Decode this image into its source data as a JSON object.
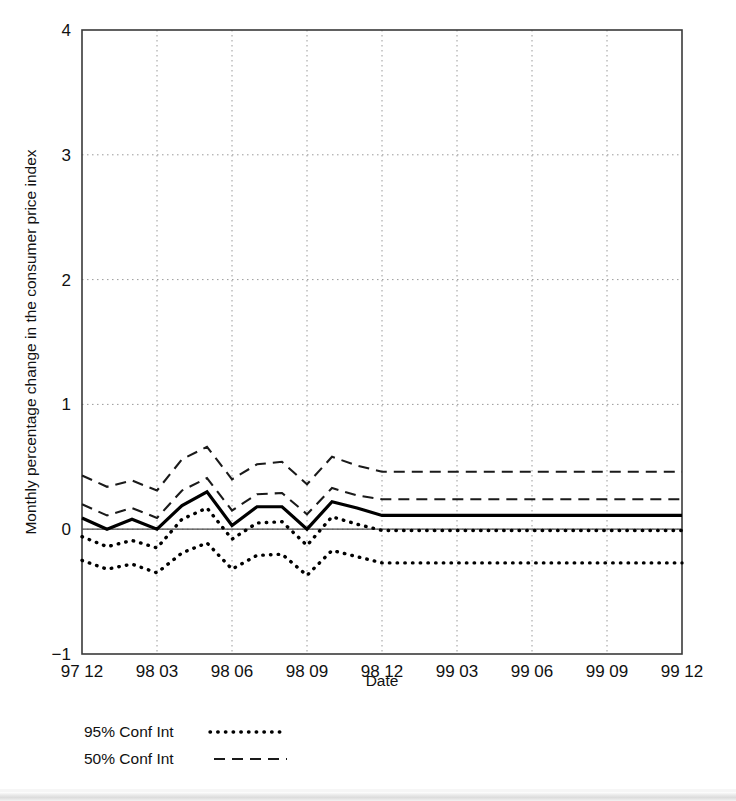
{
  "chart_data": {
    "type": "line",
    "title": "",
    "xlabel": "Date",
    "ylabel": "Monthly percentage change in the consumer price index",
    "ylim": [
      -1,
      4
    ],
    "yticks": [
      "4",
      "3",
      "2",
      "1",
      "0",
      "−1"
    ],
    "ytick_values": [
      4,
      3,
      2,
      1,
      0,
      -1
    ],
    "xticks": [
      "97 12",
      "98 03",
      "98 06",
      "98 09",
      "98 12",
      "99 03",
      "99 06",
      "99 09",
      "99 12"
    ],
    "grid": "dotted, both axes at tick positions",
    "legend_position": "below-left, outside axes",
    "legend": [
      {
        "label": "95% Conf Int",
        "style": "dotted"
      },
      {
        "label": "50% Conf Int",
        "style": "dashed"
      }
    ],
    "x": [
      "97 12",
      "98 01",
      "98 02",
      "98 03",
      "98 04",
      "98 05",
      "98 06",
      "98 07",
      "98 08",
      "98 09",
      "98 10",
      "98 11",
      "98 12",
      "99 01",
      "99 02",
      "99 03",
      "99 04",
      "99 05",
      "99 06",
      "99 07",
      "99 08",
      "99 09",
      "99 10",
      "99 11",
      "99 12"
    ],
    "series": [
      {
        "name": "Central projection",
        "style": "solid",
        "values": [
          0.09,
          0.0,
          0.08,
          0.0,
          0.19,
          0.3,
          0.03,
          0.18,
          0.18,
          0.0,
          0.22,
          0.17,
          0.11,
          0.11,
          0.11,
          0.11,
          0.11,
          0.11,
          0.11,
          0.11,
          0.11,
          0.11,
          0.11,
          0.11,
          0.11
        ]
      },
      {
        "name": "50% Conf Int upper",
        "style": "dashed",
        "values": [
          0.43,
          0.34,
          0.39,
          0.31,
          0.56,
          0.66,
          0.4,
          0.52,
          0.54,
          0.36,
          0.58,
          0.51,
          0.46,
          0.46,
          0.46,
          0.46,
          0.46,
          0.46,
          0.46,
          0.46,
          0.46,
          0.46,
          0.46,
          0.46,
          0.46
        ]
      },
      {
        "name": "50% Conf Int lower",
        "style": "dashed",
        "values": [
          0.2,
          0.11,
          0.17,
          0.09,
          0.31,
          0.41,
          0.15,
          0.28,
          0.29,
          0.12,
          0.33,
          0.27,
          0.24,
          0.24,
          0.24,
          0.24,
          0.24,
          0.24,
          0.24,
          0.24,
          0.24,
          0.24,
          0.24,
          0.24,
          0.24
        ]
      },
      {
        "name": "95% Conf Int upper",
        "style": "dotted",
        "values": [
          -0.06,
          -0.14,
          -0.09,
          -0.15,
          0.08,
          0.17,
          -0.08,
          0.05,
          0.06,
          -0.13,
          0.1,
          0.04,
          -0.01,
          -0.01,
          -0.01,
          -0.01,
          -0.01,
          -0.01,
          -0.01,
          -0.01,
          -0.01,
          -0.01,
          -0.01,
          -0.01,
          -0.01
        ]
      },
      {
        "name": "95% Conf Int lower",
        "style": "dotted",
        "values": [
          -0.25,
          -0.32,
          -0.28,
          -0.35,
          -0.19,
          -0.11,
          -0.32,
          -0.21,
          -0.2,
          -0.37,
          -0.17,
          -0.22,
          -0.27,
          -0.27,
          -0.27,
          -0.27,
          -0.27,
          -0.27,
          -0.27,
          -0.27,
          -0.27,
          -0.27,
          -0.27,
          -0.27,
          -0.27
        ]
      }
    ],
    "zero_reference_line": 0
  },
  "axis": {
    "x_title": "Date",
    "y_title": "Monthly percentage change in the consumer price index"
  },
  "colors": {
    "ink": "#000000",
    "frame": "#3a3a3a",
    "grid": "#9a9a9a",
    "background": "#ffffff"
  }
}
